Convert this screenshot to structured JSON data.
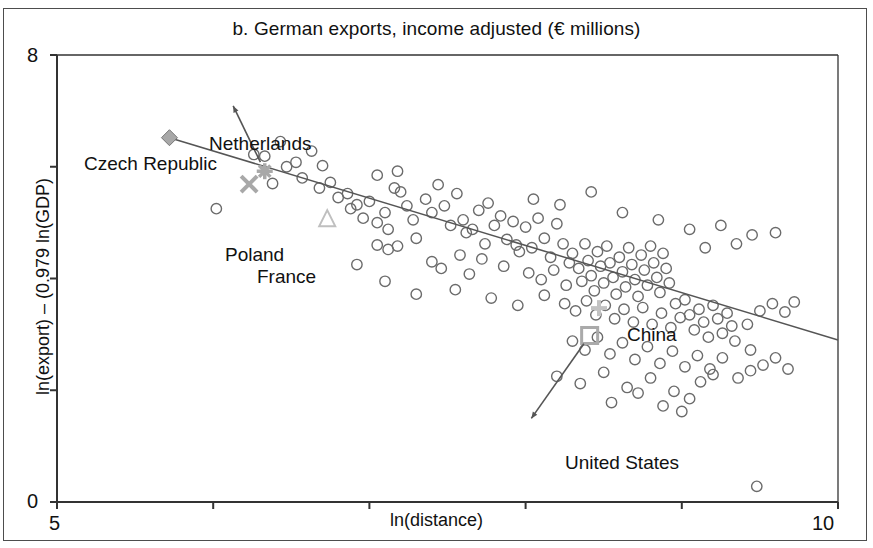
{
  "chart_data": {
    "type": "scatter",
    "title": "b. German exports, income adjusted (€ millions)",
    "xlabel": "ln(distance)",
    "ylabel": "ln(export) – (0.979 ln(GDP)",
    "xlim": [
      5,
      10
    ],
    "ylim": [
      0,
      8
    ],
    "xticks": [
      5,
      6,
      7,
      8,
      9,
      10
    ],
    "xtick_labels": [
      "5",
      "",
      "",
      "",
      "",
      "10"
    ],
    "yticks": [
      0,
      2,
      4,
      6,
      8
    ],
    "ytick_labels": [
      "0",
      "",
      "",
      "",
      "8"
    ],
    "grid": false,
    "legend": "none",
    "trendline": {
      "label": "fitted regression line",
      "x0": 5.72,
      "y0": 6.52,
      "x1": 10.0,
      "y1": 2.9,
      "color": "#555555"
    },
    "annotations": [
      {
        "name": "Czech Republic",
        "marker": "diamond",
        "color": "#a8a8a8",
        "x": 5.72,
        "y": 6.52,
        "label_x": 5.6,
        "label_y": 6.95,
        "arrow": false
      },
      {
        "name": "Netherlands",
        "marker": "asterisk",
        "color": "#a8a8a8",
        "x": 6.33,
        "y": 5.92,
        "label_x": 6.1,
        "label_y": 7.25,
        "arrow": true
      },
      {
        "name": "Poland",
        "marker": "x",
        "color": "#a8a8a8",
        "x": 6.23,
        "y": 5.69,
        "label_x": 6.1,
        "label_y": 5.45,
        "arrow": false
      },
      {
        "name": "France",
        "marker": "triangle",
        "color": "#bfbfbf",
        "x": 6.73,
        "y": 5.08,
        "label_x": 6.3,
        "label_y": 5.1,
        "arrow": false
      },
      {
        "name": "China",
        "marker": "plus",
        "color": "#c2c2c2",
        "x": 8.47,
        "y": 3.47,
        "label_x": 8.3,
        "label_y": 3.9,
        "arrow": false
      },
      {
        "name": "United States",
        "marker": "square",
        "color": "#aaaaaa",
        "x": 8.41,
        "y": 2.98,
        "label_x": 8.0,
        "label_y": 1.35,
        "arrow": true
      }
    ],
    "series": [
      {
        "name": "countries",
        "marker": "open-circle",
        "color": "#6b6b6b",
        "points": [
          [
            6.02,
            5.25
          ],
          [
            6.26,
            6.22
          ],
          [
            6.33,
            6.19
          ],
          [
            6.43,
            6.45
          ],
          [
            6.47,
            6.0
          ],
          [
            6.53,
            6.08
          ],
          [
            6.57,
            5.8
          ],
          [
            6.63,
            6.28
          ],
          [
            6.38,
            5.7
          ],
          [
            6.68,
            5.62
          ],
          [
            6.75,
            5.72
          ],
          [
            6.8,
            5.45
          ],
          [
            6.86,
            5.52
          ],
          [
            6.88,
            5.25
          ],
          [
            6.92,
            5.32
          ],
          [
            6.96,
            5.08
          ],
          [
            7.0,
            5.38
          ],
          [
            7.05,
            5.0
          ],
          [
            7.1,
            5.18
          ],
          [
            7.12,
            4.88
          ],
          [
            7.16,
            5.62
          ],
          [
            7.2,
            5.55
          ],
          [
            7.24,
            5.3
          ],
          [
            7.28,
            5.05
          ],
          [
            7.05,
            4.6
          ],
          [
            7.12,
            4.52
          ],
          [
            7.18,
            4.58
          ],
          [
            7.3,
            4.72
          ],
          [
            7.36,
            5.42
          ],
          [
            7.4,
            5.18
          ],
          [
            7.44,
            5.68
          ],
          [
            7.48,
            5.3
          ],
          [
            7.52,
            4.95
          ],
          [
            7.56,
            5.52
          ],
          [
            7.6,
            5.05
          ],
          [
            7.62,
            4.82
          ],
          [
            7.66,
            4.88
          ],
          [
            7.7,
            5.22
          ],
          [
            7.74,
            4.62
          ],
          [
            7.76,
            5.35
          ],
          [
            7.8,
            4.95
          ],
          [
            7.84,
            5.12
          ],
          [
            7.88,
            4.7
          ],
          [
            7.92,
            5.02
          ],
          [
            7.96,
            4.48
          ],
          [
            7.4,
            4.3
          ],
          [
            7.46,
            4.18
          ],
          [
            7.58,
            4.42
          ],
          [
            7.64,
            4.08
          ],
          [
            7.72,
            4.35
          ],
          [
            7.86,
            4.22
          ],
          [
            7.94,
            4.6
          ],
          [
            8.0,
            4.92
          ],
          [
            8.04,
            4.55
          ],
          [
            8.08,
            5.08
          ],
          [
            8.12,
            4.72
          ],
          [
            8.16,
            4.38
          ],
          [
            8.2,
            4.98
          ],
          [
            8.24,
            4.62
          ],
          [
            8.28,
            4.28
          ],
          [
            8.02,
            4.1
          ],
          [
            8.1,
            3.98
          ],
          [
            8.18,
            4.15
          ],
          [
            8.26,
            3.88
          ],
          [
            8.3,
            4.45
          ],
          [
            8.34,
            4.18
          ],
          [
            8.36,
            3.95
          ],
          [
            8.38,
            4.62
          ],
          [
            8.4,
            4.32
          ],
          [
            8.42,
            4.05
          ],
          [
            8.44,
            3.78
          ],
          [
            8.46,
            4.48
          ],
          [
            8.48,
            4.22
          ],
          [
            8.5,
            3.92
          ],
          [
            8.52,
            4.58
          ],
          [
            8.54,
            4.28
          ],
          [
            8.56,
            4.02
          ],
          [
            8.58,
            3.72
          ],
          [
            8.6,
            4.38
          ],
          [
            8.62,
            4.12
          ],
          [
            8.64,
            3.85
          ],
          [
            8.66,
            4.55
          ],
          [
            8.68,
            4.25
          ],
          [
            8.7,
            3.98
          ],
          [
            8.72,
            3.68
          ],
          [
            8.74,
            4.42
          ],
          [
            8.76,
            4.15
          ],
          [
            8.78,
            3.88
          ],
          [
            8.8,
            4.58
          ],
          [
            8.82,
            4.28
          ],
          [
            8.84,
            4.02
          ],
          [
            8.86,
            3.75
          ],
          [
            8.88,
            4.45
          ],
          [
            8.9,
            4.18
          ],
          [
            8.92,
            3.92
          ],
          [
            8.25,
            3.55
          ],
          [
            8.32,
            3.42
          ],
          [
            8.39,
            3.6
          ],
          [
            8.45,
            3.35
          ],
          [
            8.51,
            3.52
          ],
          [
            8.57,
            3.28
          ],
          [
            8.63,
            3.45
          ],
          [
            8.69,
            3.22
          ],
          [
            8.75,
            3.48
          ],
          [
            8.81,
            3.18
          ],
          [
            8.87,
            3.38
          ],
          [
            8.93,
            3.12
          ],
          [
            8.96,
            3.55
          ],
          [
            8.99,
            3.3
          ],
          [
            9.02,
            3.62
          ],
          [
            9.05,
            3.35
          ],
          [
            9.08,
            3.08
          ],
          [
            9.11,
            3.45
          ],
          [
            9.14,
            3.22
          ],
          [
            9.17,
            2.95
          ],
          [
            9.2,
            3.52
          ],
          [
            9.23,
            3.28
          ],
          [
            9.26,
            3.02
          ],
          [
            9.29,
            3.38
          ],
          [
            9.32,
            3.15
          ],
          [
            8.3,
            2.88
          ],
          [
            8.38,
            2.72
          ],
          [
            8.46,
            2.95
          ],
          [
            8.54,
            2.65
          ],
          [
            8.62,
            2.85
          ],
          [
            8.7,
            2.55
          ],
          [
            8.78,
            2.78
          ],
          [
            8.86,
            2.48
          ],
          [
            8.94,
            2.7
          ],
          [
            9.02,
            2.42
          ],
          [
            9.1,
            2.62
          ],
          [
            9.18,
            2.38
          ],
          [
            9.26,
            2.58
          ],
          [
            9.34,
            2.88
          ],
          [
            9.42,
            3.18
          ],
          [
            9.5,
            3.42
          ],
          [
            9.58,
            3.55
          ],
          [
            9.66,
            3.4
          ],
          [
            9.72,
            3.58
          ],
          [
            9.44,
            2.72
          ],
          [
            9.52,
            2.45
          ],
          [
            9.6,
            2.58
          ],
          [
            9.68,
            2.38
          ],
          [
            9.36,
            2.22
          ],
          [
            9.44,
            2.35
          ],
          [
            9.12,
            2.15
          ],
          [
            9.2,
            2.28
          ],
          [
            8.2,
            2.25
          ],
          [
            8.35,
            2.12
          ],
          [
            8.5,
            2.32
          ],
          [
            8.65,
            2.05
          ],
          [
            8.8,
            2.22
          ],
          [
            8.95,
            1.98
          ],
          [
            9.05,
            1.85
          ],
          [
            8.55,
            1.78
          ],
          [
            8.72,
            1.95
          ],
          [
            8.88,
            1.72
          ],
          [
            9.0,
            1.62
          ],
          [
            7.1,
            3.95
          ],
          [
            7.3,
            3.72
          ],
          [
            7.55,
            3.8
          ],
          [
            7.78,
            3.65
          ],
          [
            7.95,
            3.52
          ],
          [
            8.12,
            3.7
          ],
          [
            6.92,
            4.25
          ],
          [
            9.48,
            0.28
          ],
          [
            8.22,
            5.32
          ],
          [
            8.42,
            5.55
          ],
          [
            8.62,
            5.18
          ],
          [
            8.05,
            5.42
          ],
          [
            8.85,
            5.05
          ],
          [
            9.05,
            4.88
          ],
          [
            9.25,
            4.95
          ],
          [
            9.45,
            4.78
          ],
          [
            9.6,
            4.82
          ],
          [
            7.05,
            5.85
          ],
          [
            7.18,
            5.92
          ],
          [
            6.7,
            6.02
          ],
          [
            9.15,
            4.55
          ],
          [
            9.35,
            4.62
          ]
        ]
      }
    ]
  }
}
